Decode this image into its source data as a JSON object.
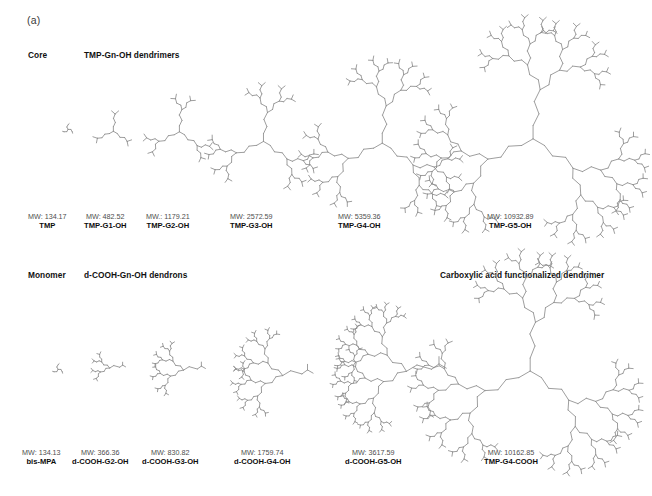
{
  "figure": {
    "panel_label": "(a)",
    "background_color": "#ffffff",
    "structure_line_color": "#8c8c8c",
    "caption_mw_color": "#4d4d4d",
    "caption_name_color": "#0d0d0d"
  },
  "headers": {
    "core": "Core",
    "dendrimers": "TMP-Gn-OH dendrimers",
    "monomer": "Monomer",
    "dendrons": "d-COOH-Gn-OH dendrons",
    "carboxylic": "Carboxylic acid functionalized dendrimer"
  },
  "rows": [
    {
      "row_name": "tmp-gn-oh-dendrimers",
      "items": [
        {
          "mw": "MW: 134.17",
          "name": "TMP",
          "generation": 0,
          "shape": "core",
          "x": 68,
          "y": 128,
          "scale": 0.3,
          "cap_x": 28,
          "cap_y": 213
        },
        {
          "mw": "MW: 482.52",
          "name": "TMP-G1-OH",
          "generation": 1,
          "shape": "dendrimer",
          "x": 112,
          "y": 128,
          "scale": 0.46,
          "cap_x": 84,
          "cap_y": 213
        },
        {
          "mw": "MW.: 1179.21",
          "name": "TMP-G2-OH",
          "generation": 2,
          "shape": "dendrimer",
          "x": 178,
          "y": 128,
          "scale": 0.6,
          "cap_x": 146,
          "cap_y": 213
        },
        {
          "mw": "MW: 2572.59",
          "name": "TMP-G3-OH",
          "generation": 3,
          "shape": "dendrimer",
          "x": 262,
          "y": 136,
          "scale": 0.78,
          "cap_x": 230,
          "cap_y": 213
        },
        {
          "mw": "MW: 5359.36",
          "name": "TMP-G4-OH",
          "generation": 4,
          "shape": "dendrimer",
          "x": 381,
          "y": 136,
          "scale": 1.0,
          "cap_x": 338,
          "cap_y": 213
        },
        {
          "mw": "MW: 10932.89",
          "name": "TMP-G5-OH",
          "generation": 5,
          "shape": "dendrimer",
          "x": 530,
          "y": 130,
          "scale": 1.32,
          "cap_x": 487,
          "cap_y": 213
        }
      ]
    },
    {
      "row_name": "d-cooh-gn-oh-dendrons",
      "items": [
        {
          "mw": "MW: 134.13",
          "name": "bis-MPA",
          "generation": 0,
          "shape": "core",
          "x": 58,
          "y": 368,
          "scale": 0.3,
          "cap_x": 22,
          "cap_y": 449
        },
        {
          "mw": "MW: 366.36",
          "name": "d-COOH-G2-OH",
          "generation": 2,
          "shape": "dendron",
          "x": 108,
          "y": 366,
          "scale": 0.42,
          "cap_x": 72,
          "cap_y": 449
        },
        {
          "mw": "MW: 830.82",
          "name": "d-COOH-G3-OH",
          "generation": 3,
          "shape": "dendron",
          "x": 178,
          "y": 368,
          "scale": 0.58,
          "cap_x": 142,
          "cap_y": 449
        },
        {
          "mw": "MW: 1759.74",
          "name": "d-COOH-G4-OH",
          "generation": 4,
          "shape": "dendron",
          "x": 272,
          "y": 372,
          "scale": 0.8,
          "cap_x": 234,
          "cap_y": 449
        },
        {
          "mw": "MW: 3617.59",
          "name": "d-COOH-G5-OH",
          "generation": 5,
          "shape": "dendron",
          "x": 388,
          "y": 368,
          "scale": 1.05,
          "cap_x": 345,
          "cap_y": 449
        },
        {
          "mw": "MW: 10162.85",
          "name": "TMP-G4-COOH",
          "generation": 5,
          "shape": "dendrimer",
          "x": 525,
          "y": 362,
          "scale": 1.3,
          "cap_x": 484,
          "cap_y": 449
        }
      ]
    }
  ]
}
